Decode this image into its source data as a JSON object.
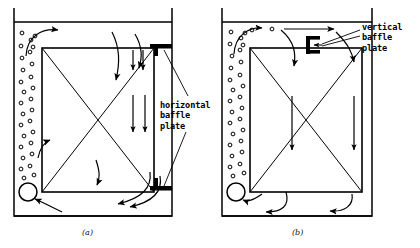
{
  "figure": {
    "kind": "bubble-column-reactor-schematic",
    "panels": [
      {
        "id": "a",
        "caption": "(a)",
        "label": "horizontal\nbaffle\nplate",
        "label_lines": [
          "horizontal",
          "baffle",
          "plate"
        ],
        "baffle_type": "horizontal",
        "baffle_count": 2,
        "description": "Bubble column with internal draft box and two horizontal baffle plates on the right wall"
      },
      {
        "id": "b",
        "caption": "(b)",
        "label": "vertical\nbaffle\nplate",
        "label_lines": [
          "vertical",
          "baffle",
          "plate"
        ],
        "baffle_type": "vertical",
        "baffle_count": 1,
        "description": "Bubble column with internal draft box and one vertical baffle plate near the top surface"
      }
    ],
    "elements": {
      "bubbles_name": "bubble-riser-column",
      "sparger_name": "sparger-circle",
      "inner_box_name": "inner-draft-box",
      "diagonal_name": "diagonal-cross-lines",
      "flow_arrow_name": "circulation-flow-arrow",
      "leader_name": "label-leader-line",
      "tank_name": "tank-outline",
      "surface_name": "liquid-surface-line"
    },
    "colors": {
      "ink": "#000000",
      "background": "#ffffff"
    }
  }
}
